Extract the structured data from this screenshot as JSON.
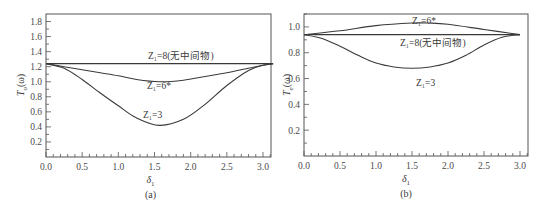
{
  "chart_data": [
    {
      "type": "line",
      "panel": "(a)",
      "caption": "(a)",
      "xlabel": "δ1",
      "ylabel": "To(ω)",
      "xlim": [
        0.0,
        3.14
      ],
      "ylim": [
        0.0,
        1.9
      ],
      "xticks": [
        "0.0",
        "0.5",
        "1.0",
        "1.5",
        "2.0",
        "2.5",
        "3.0"
      ],
      "yticks": [
        "0.2",
        "0.4",
        "0.6",
        "0.8",
        "1.0",
        "1.2",
        "1.4",
        "1.6",
        "1.8"
      ],
      "grid": false,
      "series": [
        {
          "name": "Z1=8(无中间物)",
          "label": "Z1=8(无中间物)",
          "x": [
            0.0,
            0.5,
            1.0,
            1.57,
            2.0,
            2.5,
            3.14
          ],
          "y": [
            1.24,
            1.24,
            1.24,
            1.24,
            1.24,
            1.24,
            1.24
          ]
        },
        {
          "name": "Z1=6*",
          "label": "Z1=6*",
          "x": [
            0.0,
            0.25,
            0.5,
            0.75,
            1.0,
            1.25,
            1.57,
            1.9,
            2.2,
            2.5,
            2.8,
            3.0,
            3.14
          ],
          "y": [
            1.24,
            1.2,
            1.16,
            1.12,
            1.08,
            1.03,
            1.0,
            1.02,
            1.07,
            1.12,
            1.18,
            1.22,
            1.24
          ]
        },
        {
          "name": "Z1=3",
          "label": "Z1=3",
          "x": [
            0.0,
            0.25,
            0.5,
            0.75,
            1.0,
            1.25,
            1.57,
            1.9,
            2.2,
            2.5,
            2.8,
            3.0,
            3.14
          ],
          "y": [
            1.24,
            1.18,
            1.03,
            0.85,
            0.68,
            0.52,
            0.42,
            0.5,
            0.7,
            0.95,
            1.15,
            1.22,
            1.24
          ]
        }
      ]
    },
    {
      "type": "line",
      "panel": "(b)",
      "caption": "(b)",
      "xlabel": "δ1",
      "ylabel": "Te(ω)",
      "xlim": [
        0.0,
        3.1
      ],
      "ylim": [
        0.0,
        1.1
      ],
      "xticks": [
        "0.0",
        "0.5",
        "1.0",
        "1.5",
        "2.0",
        "2.5",
        "3.0"
      ],
      "yticks": [
        "0.2",
        "0.4",
        "0.6",
        "0.8",
        "1.0"
      ],
      "grid": false,
      "series": [
        {
          "name": "Z1=6*",
          "label": "Z1=6*",
          "x": [
            0.0,
            0.5,
            1.0,
            1.5,
            1.75,
            2.0,
            2.5,
            3.0
          ],
          "y": [
            0.94,
            0.97,
            1.01,
            1.03,
            1.03,
            1.02,
            0.98,
            0.94
          ]
        },
        {
          "name": "Z1=8(无中间物)",
          "label": "Z1=8(无中间物)",
          "x": [
            0.0,
            0.5,
            1.0,
            1.5,
            2.0,
            2.5,
            3.0
          ],
          "y": [
            0.94,
            0.94,
            0.94,
            0.94,
            0.94,
            0.94,
            0.94
          ]
        },
        {
          "name": "Z1=3",
          "label": "Z1=3",
          "x": [
            0.0,
            0.25,
            0.5,
            0.75,
            1.0,
            1.25,
            1.5,
            1.75,
            2.0,
            2.25,
            2.5,
            2.75,
            3.0
          ],
          "y": [
            0.94,
            0.91,
            0.85,
            0.78,
            0.72,
            0.69,
            0.68,
            0.69,
            0.72,
            0.78,
            0.86,
            0.92,
            0.94
          ]
        }
      ]
    }
  ],
  "panel_a": {
    "caption": "(a)",
    "xlabel_main": "δ",
    "xlabel_sub": "1",
    "ylabel_main": "T",
    "ylabel_sub": "o",
    "ylabel_arg": "(ω)",
    "labels": {
      "z8": "Z₁=8(无中间物)",
      "z6": "Z₁=6*",
      "z3": "Z₁=3"
    }
  },
  "panel_b": {
    "caption": "(b)",
    "xlabel_main": "δ",
    "xlabel_sub": "1",
    "ylabel_main": "T",
    "ylabel_sub": "e",
    "ylabel_arg": "(ω)",
    "labels": {
      "z6": "Z₁=6*",
      "z8": "Z₁=8(无中间物)",
      "z3": "Z₁=3"
    }
  },
  "colors": {
    "line": "#3a3a3a",
    "frame": "#555555"
  }
}
